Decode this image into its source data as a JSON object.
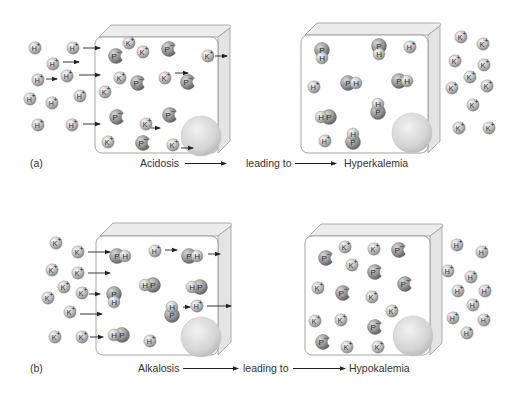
{
  "colors": {
    "ion_light": "#e2e2e2",
    "ion_dark": "#8d8d8d",
    "protein_light": "#b9b9b9",
    "protein_dark": "#6e6e6e",
    "box_stroke": "#9a9a9a",
    "box_face": "#ffffff",
    "box_bevel": "#ececec",
    "nucleus": "#d6d6d6",
    "arrow": "#222222",
    "text": "#333333"
  },
  "panels": [
    {
      "id": "a",
      "panel_label": "(a)",
      "caption": {
        "cause": "Acidosis",
        "middle": "leading to",
        "effect": "Hyperkalemia"
      },
      "caption_y": 167,
      "label_x": 30,
      "cause_x": 140,
      "arrow1": [
        185,
        226
      ],
      "middle_x": 246,
      "arrow2": [
        295,
        336
      ],
      "effect_x": 344,
      "cells": [
        {
          "name": "cell-before-acidosis",
          "x": 95,
          "y": 37,
          "w": 123,
          "h": 116,
          "bevel": 12,
          "nucleus": {
            "cx": 201,
            "cy": 136,
            "r": 20
          },
          "particles": [
            {
              "t": "K+",
              "x": 129,
              "y": 43
            },
            {
              "t": "K+",
              "x": 143,
              "y": 52
            },
            {
              "t": "P-",
              "x": 169,
              "y": 49
            },
            {
              "t": "P-",
              "x": 116,
              "y": 56
            },
            {
              "t": "K+",
              "x": 208,
              "y": 56
            },
            {
              "t": "K+",
              "x": 120,
              "y": 78
            },
            {
              "t": "P-",
              "x": 138,
              "y": 83
            },
            {
              "t": "K+",
              "x": 165,
              "y": 78
            },
            {
              "t": "P-",
              "x": 188,
              "y": 82
            },
            {
              "t": "K+",
              "x": 105,
              "y": 92
            },
            {
              "t": "P-",
              "x": 117,
              "y": 117
            },
            {
              "t": "P-",
              "x": 170,
              "y": 115
            },
            {
              "t": "K+",
              "x": 146,
              "y": 124
            },
            {
              "t": "K+",
              "x": 108,
              "y": 142
            },
            {
              "t": "P-",
              "x": 143,
              "y": 143
            },
            {
              "t": "K+",
              "x": 173,
              "y": 145
            }
          ],
          "arrows": [
            {
              "x1": 83,
              "y1": 48,
              "x2": 100,
              "y2": 48
            },
            {
              "x1": 63,
              "y1": 62,
              "x2": 79,
              "y2": 62
            },
            {
              "x1": 46,
              "y1": 79,
              "x2": 57,
              "y2": 79
            },
            {
              "x1": 79,
              "y1": 75,
              "x2": 100,
              "y2": 75
            },
            {
              "x1": 83,
              "y1": 124,
              "x2": 100,
              "y2": 124
            },
            {
              "x1": 175,
              "y1": 73,
              "x2": 188,
              "y2": 73
            },
            {
              "x1": 151,
              "y1": 128,
              "x2": 160,
              "y2": 128
            },
            {
              "x1": 181,
              "y1": 148,
              "x2": 193,
              "y2": 148
            },
            {
              "x1": 215,
              "y1": 56,
              "x2": 227,
              "y2": 56
            }
          ]
        },
        {
          "name": "cell-after-acidosis",
          "x": 301,
          "y": 35,
          "w": 127,
          "h": 118,
          "bevel": 12,
          "nucleus": {
            "cx": 412,
            "cy": 133,
            "r": 20
          },
          "particles": [
            {
              "t": "PH-v",
              "x": 322,
              "y": 54
            },
            {
              "t": "PH-v",
              "x": 379,
              "y": 50
            },
            {
              "t": "H+",
              "x": 410,
              "y": 47
            },
            {
              "t": "H+",
              "x": 314,
              "y": 87
            },
            {
              "t": "PH-h",
              "x": 352,
              "y": 83
            },
            {
              "t": "PH-h",
              "x": 403,
              "y": 81
            },
            {
              "t": "HP-h",
              "x": 325,
              "y": 117
            },
            {
              "t": "HP-v",
              "x": 378,
              "y": 108
            },
            {
              "t": "H+",
              "x": 325,
              "y": 141
            },
            {
              "t": "HP-v",
              "x": 353,
              "y": 138
            }
          ],
          "arrows": []
        }
      ],
      "outside": [
        {
          "t": "H+",
          "x": 35,
          "y": 48
        },
        {
          "t": "H+",
          "x": 73,
          "y": 48
        },
        {
          "t": "H+",
          "x": 53,
          "y": 64
        },
        {
          "t": "H+",
          "x": 38,
          "y": 80
        },
        {
          "t": "H+",
          "x": 67,
          "y": 76
        },
        {
          "t": "H+",
          "x": 30,
          "y": 99
        },
        {
          "t": "H+",
          "x": 52,
          "y": 103
        },
        {
          "t": "H+",
          "x": 80,
          "y": 96
        },
        {
          "t": "H+",
          "x": 38,
          "y": 125
        },
        {
          "t": "H+",
          "x": 72,
          "y": 125
        },
        {
          "t": "K+",
          "x": 461,
          "y": 37
        },
        {
          "t": "K+",
          "x": 483,
          "y": 44
        },
        {
          "t": "K+",
          "x": 455,
          "y": 61
        },
        {
          "t": "K+",
          "x": 484,
          "y": 65
        },
        {
          "t": "K+",
          "x": 470,
          "y": 77
        },
        {
          "t": "K+",
          "x": 452,
          "y": 88
        },
        {
          "t": "K+",
          "x": 487,
          "y": 86
        },
        {
          "t": "K+",
          "x": 473,
          "y": 105
        },
        {
          "t": "K+",
          "x": 459,
          "y": 128
        },
        {
          "t": "K+",
          "x": 489,
          "y": 128
        }
      ]
    },
    {
      "id": "b",
      "panel_label": "(b)",
      "caption": {
        "cause": "Alkalosis",
        "middle": "leading to",
        "effect": "Hypokalemia"
      },
      "caption_y": 372,
      "label_x": 30,
      "cause_x": 138,
      "arrow1": [
        183,
        238
      ],
      "middle_x": 243,
      "arrow2": [
        293,
        345
      ],
      "effect_x": 349,
      "cells": [
        {
          "name": "cell-before-alkalosis",
          "x": 96,
          "y": 236,
          "w": 122,
          "h": 119,
          "bevel": 13,
          "nucleus": {
            "cx": 201,
            "cy": 337,
            "r": 20
          },
          "particles": [
            {
              "t": "PH-h",
              "x": 121,
              "y": 256
            },
            {
              "t": "H+",
              "x": 155,
              "y": 251
            },
            {
              "t": "PH-h",
              "x": 193,
              "y": 256
            },
            {
              "t": "HP-h",
              "x": 149,
              "y": 285
            },
            {
              "t": "HP-h",
              "x": 196,
              "y": 287
            },
            {
              "t": "PH-v",
              "x": 114,
              "y": 298
            },
            {
              "t": "HP-v",
              "x": 172,
              "y": 311
            },
            {
              "t": "H+",
              "x": 197,
              "y": 306
            },
            {
              "t": "HP-h",
              "x": 118,
              "y": 335
            },
            {
              "t": "H+",
              "x": 150,
              "y": 341
            }
          ],
          "arrows": [
            {
              "x1": 88,
              "y1": 252,
              "x2": 110,
              "y2": 252
            },
            {
              "x1": 88,
              "y1": 273,
              "x2": 110,
              "y2": 273
            },
            {
              "x1": 89,
              "y1": 294,
              "x2": 100,
              "y2": 294
            },
            {
              "x1": 80,
              "y1": 314,
              "x2": 102,
              "y2": 314
            },
            {
              "x1": 90,
              "y1": 337,
              "x2": 103,
              "y2": 337
            },
            {
              "x1": 165,
              "y1": 250,
              "x2": 177,
              "y2": 250
            },
            {
              "x1": 208,
              "y1": 254,
              "x2": 220,
              "y2": 254
            },
            {
              "x1": 183,
              "y1": 307,
              "x2": 190,
              "y2": 307
            },
            {
              "x1": 207,
              "y1": 306,
              "x2": 231,
              "y2": 306
            }
          ]
        },
        {
          "name": "cell-after-alkalosis",
          "x": 305,
          "y": 236,
          "w": 125,
          "h": 119,
          "bevel": 12,
          "nucleus": {
            "cx": 413,
            "cy": 336,
            "r": 20
          },
          "particles": [
            {
              "t": "K+",
              "x": 345,
              "y": 247
            },
            {
              "t": "K+",
              "x": 374,
              "y": 249
            },
            {
              "t": "P-",
              "x": 399,
              "y": 250
            },
            {
              "t": "P-",
              "x": 326,
              "y": 258
            },
            {
              "t": "K+",
              "x": 352,
              "y": 265
            },
            {
              "t": "P-",
              "x": 375,
              "y": 272
            },
            {
              "t": "K+",
              "x": 318,
              "y": 288
            },
            {
              "t": "P-",
              "x": 343,
              "y": 293
            },
            {
              "t": "P-",
              "x": 405,
              "y": 284
            },
            {
              "t": "K+",
              "x": 372,
              "y": 297
            },
            {
              "t": "K+",
              "x": 392,
              "y": 311
            },
            {
              "t": "K+",
              "x": 315,
              "y": 321
            },
            {
              "t": "K+",
              "x": 341,
              "y": 320
            },
            {
              "t": "P-",
              "x": 375,
              "y": 327
            },
            {
              "t": "P-",
              "x": 323,
              "y": 342
            },
            {
              "t": "K+",
              "x": 347,
              "y": 347
            },
            {
              "t": "K+",
              "x": 378,
              "y": 347
            }
          ],
          "arrows": []
        }
      ],
      "outside": [
        {
          "t": "K+",
          "x": 56,
          "y": 243
        },
        {
          "t": "K+",
          "x": 78,
          "y": 252
        },
        {
          "t": "K+",
          "x": 52,
          "y": 270
        },
        {
          "t": "K+",
          "x": 78,
          "y": 273
        },
        {
          "t": "K+",
          "x": 64,
          "y": 287
        },
        {
          "t": "K+",
          "x": 48,
          "y": 298
        },
        {
          "t": "K+",
          "x": 82,
          "y": 293
        },
        {
          "t": "K+",
          "x": 70,
          "y": 312
        },
        {
          "t": "K+",
          "x": 55,
          "y": 337
        },
        {
          "t": "K+",
          "x": 82,
          "y": 337
        },
        {
          "t": "H+",
          "x": 457,
          "y": 245
        },
        {
          "t": "H+",
          "x": 482,
          "y": 252
        },
        {
          "t": "H+",
          "x": 448,
          "y": 271
        },
        {
          "t": "H+",
          "x": 471,
          "y": 277
        },
        {
          "t": "H+",
          "x": 458,
          "y": 291
        },
        {
          "t": "H+",
          "x": 485,
          "y": 291
        },
        {
          "t": "H+",
          "x": 473,
          "y": 305
        },
        {
          "t": "H+",
          "x": 453,
          "y": 318
        },
        {
          "t": "H+",
          "x": 484,
          "y": 320
        },
        {
          "t": "H+",
          "x": 467,
          "y": 333
        }
      ]
    }
  ],
  "glyphs": {
    "K+": {
      "main": "K",
      "sup": "+"
    },
    "H+": {
      "main": "H",
      "sup": "+"
    },
    "P-": {
      "main": "P",
      "sup": "−"
    },
    "P": "P",
    "H": "H"
  }
}
